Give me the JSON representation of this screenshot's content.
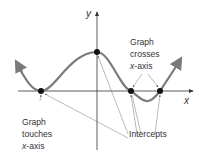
{
  "diagram": {
    "axes": {
      "x_label": "x",
      "y_label": "y"
    },
    "curve_color": "#7a7a7a",
    "labels": {
      "crosses": {
        "line1": "Graph",
        "line2": "crosses",
        "line3_var": "x",
        "line3_rest": "-axis"
      },
      "touches": {
        "line1": "Graph",
        "line2": "touches",
        "line3_var": "x",
        "line3_rest": "-axis"
      },
      "intercepts": "Intercepts"
    },
    "points": [
      {
        "name": "touch-intercept",
        "x": 41,
        "y": 91
      },
      {
        "name": "y-intercept",
        "x": 97,
        "y": 52
      },
      {
        "name": "cross-intercept-1",
        "x": 131,
        "y": 91
      },
      {
        "name": "cross-intercept-2",
        "x": 160,
        "y": 91
      }
    ]
  }
}
